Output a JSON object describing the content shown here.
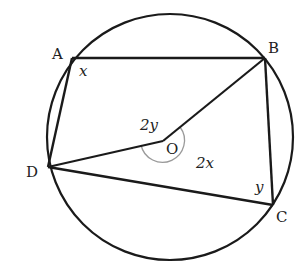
{
  "diagram": {
    "colors": {
      "stroke": "#1a1a1a",
      "arc": "#9a9a9a",
      "text": "#222222",
      "background": "#ffffff"
    },
    "circle": {
      "cx": 170,
      "cy": 137,
      "r": 123,
      "label": ""
    },
    "points": {
      "A": {
        "label": "A",
        "x": 72,
        "y": 58
      },
      "B": {
        "label": "B",
        "x": 265,
        "y": 58
      },
      "C": {
        "label": "C",
        "x": 273,
        "y": 205
      },
      "D": {
        "label": "D",
        "x": 48,
        "y": 167
      },
      "O": {
        "label": "O",
        "x": 163,
        "y": 141
      }
    },
    "angle_labels": {
      "at_A": "x",
      "at_C": "y",
      "at_O_minor": "2y",
      "at_O_reflex": "2x"
    }
  }
}
